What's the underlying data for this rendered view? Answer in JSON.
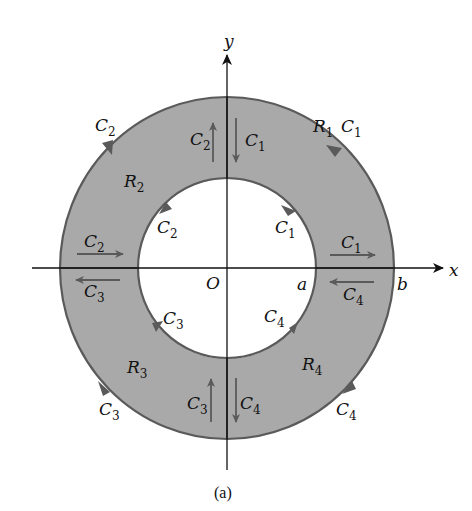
{
  "figure": {
    "caption": "(a)",
    "axes": {
      "x_label": "x",
      "y_label": "y",
      "origin_label": "O"
    },
    "radii_labels": {
      "inner": "a",
      "outer": "b"
    },
    "colors": {
      "region_fill": "#a9a9a9",
      "boundary": "#5a5a5a",
      "axis": "#111111",
      "background": "#ffffff"
    },
    "regions": [
      {
        "id": "R1",
        "letter": "R",
        "sub": "1",
        "quadrant": "I"
      },
      {
        "id": "R2",
        "letter": "R",
        "sub": "2",
        "quadrant": "II"
      },
      {
        "id": "R3",
        "letter": "R",
        "sub": "3",
        "quadrant": "III"
      },
      {
        "id": "R4",
        "letter": "R",
        "sub": "4",
        "quadrant": "IV"
      }
    ],
    "curve_labels": {
      "c1_outer": {
        "letter": "C",
        "sub": "1"
      },
      "c1_inner": {
        "letter": "C",
        "sub": "1"
      },
      "c1_xaxis": {
        "letter": "C",
        "sub": "1"
      },
      "c1_yaxis": {
        "letter": "C",
        "sub": "1"
      },
      "c2_outer": {
        "letter": "C",
        "sub": "2"
      },
      "c2_inner": {
        "letter": "C",
        "sub": "2"
      },
      "c2_xaxis": {
        "letter": "C",
        "sub": "2"
      },
      "c2_yaxis": {
        "letter": "C",
        "sub": "2"
      },
      "c3_outer": {
        "letter": "C",
        "sub": "3"
      },
      "c3_inner": {
        "letter": "C",
        "sub": "3"
      },
      "c3_xaxis": {
        "letter": "C",
        "sub": "3"
      },
      "c3_yaxis": {
        "letter": "C",
        "sub": "3"
      },
      "c4_outer": {
        "letter": "C",
        "sub": "4"
      },
      "c4_inner": {
        "letter": "C",
        "sub": "4"
      },
      "c4_xaxis": {
        "letter": "C",
        "sub": "4"
      },
      "c4_yaxis": {
        "letter": "C",
        "sub": "4"
      }
    }
  }
}
